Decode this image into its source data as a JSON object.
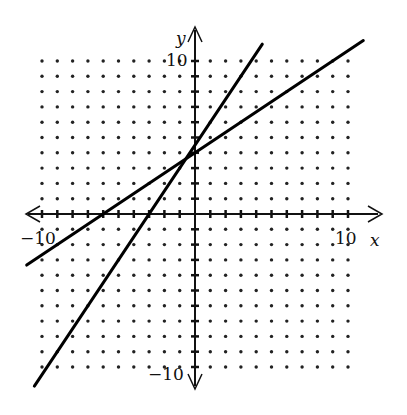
{
  "chart_data": {
    "type": "line",
    "title": "",
    "xlabel": "x",
    "ylabel": "y",
    "xlim": [
      -10,
      10
    ],
    "ylim": [
      -10,
      10
    ],
    "grid": "dotted",
    "tick_labels": {
      "x_min": "−10",
      "x_max": "10",
      "y_min": "−10",
      "y_max": "10"
    },
    "series": [
      {
        "name": "line-steep",
        "slope": 1.5,
        "intercept": 4.5,
        "x_range": [
          -10.5,
          4.4
        ],
        "points": [
          [
            -3,
            0
          ],
          [
            0,
            4.5
          ],
          [
            3,
            9
          ]
        ]
      },
      {
        "name": "line-shallow",
        "slope": 0.667,
        "intercept": 4,
        "x_range": [
          -11,
          11
        ],
        "points": [
          [
            -6,
            0
          ],
          [
            0,
            4
          ],
          [
            6,
            8
          ]
        ]
      }
    ]
  },
  "axes": {
    "x_label": "x",
    "y_label": "y",
    "x_min_label": "−10",
    "x_max_label": "10",
    "y_min_label": "−10",
    "y_max_label": "10"
  }
}
